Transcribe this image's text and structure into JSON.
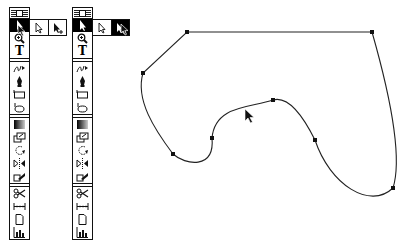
{
  "toolbox_left": {
    "tools": [
      {
        "name": "selection-tool",
        "icon": "arrow-icon",
        "selected": true
      },
      {
        "name": "zoom-tool",
        "icon": "magnifier-icon"
      },
      {
        "name": "type-tool",
        "icon": "type-icon",
        "glyph": "T"
      },
      {
        "name": "freehand-tool",
        "icon": "freehand-icon"
      },
      {
        "name": "pen-tool",
        "icon": "pen-icon"
      },
      {
        "name": "rectangle-tool",
        "icon": "rectangle-icon"
      },
      {
        "name": "rotate-tool",
        "icon": "rotate-icon"
      },
      {
        "name": "gradient-tool",
        "icon": "gradient-icon"
      },
      {
        "name": "scale-tool",
        "icon": "scale-icon"
      },
      {
        "name": "rotate-object-tool",
        "icon": "rotate-object-icon"
      },
      {
        "name": "reflect-tool",
        "icon": "reflect-icon"
      },
      {
        "name": "shear-tool",
        "icon": "shear-icon"
      },
      {
        "name": "scissors-tool",
        "icon": "scissors-icon"
      },
      {
        "name": "measure-tool",
        "icon": "measure-icon"
      },
      {
        "name": "page-tool",
        "icon": "page-icon"
      },
      {
        "name": "graph-tool",
        "icon": "graph-icon"
      }
    ],
    "flyout": [
      "direct-selection",
      "group-selection"
    ],
    "flyout_active": -1
  },
  "toolbox_right": {
    "flyout": [
      "direct-selection",
      "group-selection"
    ],
    "flyout_active": 1
  },
  "type_glyph": "T",
  "path": {
    "anchors": [
      [
        187,
        32
      ],
      [
        372,
        32
      ],
      [
        393,
        188
      ],
      [
        315,
        140
      ],
      [
        273,
        100
      ],
      [
        212,
        138
      ],
      [
        173,
        154
      ],
      [
        143,
        73
      ]
    ],
    "stroke": "#222222"
  },
  "colors": {
    "ink": "#111111",
    "background": "#ffffff"
  }
}
